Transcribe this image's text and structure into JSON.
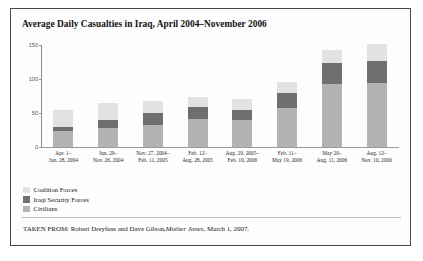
{
  "figure": {
    "title": "Average Daily Casualties in Iraq, April 2004–November 2006",
    "source_prefix": "TAKEN FROM: Robert Dreyfuss and Dave Gilson,",
    "source_italic": "Mother Jones",
    "source_suffix": ", March 1, 2007."
  },
  "legend": {
    "position": "below-plot-left",
    "items": [
      {
        "label": "Coalition Forces",
        "color": "#e2e2e2"
      },
      {
        "label": "Iraqi Security Forces",
        "color": "#6f6f6f"
      },
      {
        "label": "Civilians",
        "color": "#b3b3b3"
      }
    ]
  },
  "chart_data": {
    "type": "bar",
    "stacked": true,
    "title": "Average Daily Casualties in Iraq, April 2004–November 2006",
    "xlabel": "",
    "ylabel": "",
    "ylim": [
      0,
      150
    ],
    "yticks": [
      0,
      50,
      100,
      150
    ],
    "ytick_labels": [
      "0",
      "50",
      "100",
      "150"
    ],
    "grid": false,
    "categories": [
      "Apr. 1–Jun. 28, 2004",
      "Jun. 29–Nov. 26, 2004",
      "Nov. 27, 2004–Feb. 11, 2005",
      "Feb. 12–Aug. 28, 2005",
      "Aug. 29, 2005–Feb. 10, 2006",
      "Feb. 11–May 19, 2006",
      "May 20–Aug. 11, 2006",
      "Aug. 12–Nov. 10, 2006"
    ],
    "category_lines": [
      [
        "Apr. 1–",
        "Jun. 28, 2004"
      ],
      [
        "Jun. 29–",
        "Nov. 26, 2004"
      ],
      [
        "Nov. 27, 2004–",
        "Feb. 11, 2005"
      ],
      [
        "Feb. 12–",
        "Aug. 28, 2005"
      ],
      [
        "Aug. 29, 2005–",
        "Feb. 10, 2006"
      ],
      [
        "Feb. 11–",
        "May 19, 2006"
      ],
      [
        "May 20–",
        "Aug. 11, 2006"
      ],
      [
        "Aug. 12–",
        "Nov. 10, 2006"
      ]
    ],
    "series": [
      {
        "name": "Civilians",
        "color": "#b3b3b3",
        "values": [
          23,
          28,
          32,
          41,
          40,
          58,
          92,
          94
        ]
      },
      {
        "name": "Iraqi Security Forces",
        "color": "#6f6f6f",
        "values": [
          6,
          12,
          18,
          18,
          15,
          22,
          32,
          33
        ]
      },
      {
        "name": "Coalition Forces",
        "color": "#e2e2e2",
        "values": [
          25,
          25,
          17,
          15,
          16,
          16,
          18,
          24
        ]
      }
    ],
    "totals": [
      54,
      65,
      67,
      74,
      71,
      96,
      142,
      151
    ],
    "stack_order_bottom_to_top": [
      "Civilians",
      "Iraqi Security Forces",
      "Coalition Forces"
    ]
  }
}
